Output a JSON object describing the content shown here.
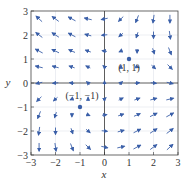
{
  "chart_data": {
    "type": "vector_field",
    "title": "",
    "xlabel": "x",
    "ylabel": "y",
    "xlim": [
      -3,
      3
    ],
    "ylim": [
      -3,
      3
    ],
    "xticks": [
      "-3",
      "-2",
      "-1",
      "0",
      "1",
      "2",
      "3"
    ],
    "yticks": [
      "-3",
      "-2",
      "-1",
      "0",
      "1",
      "2",
      "3"
    ],
    "grid": true,
    "arrow_color": "#3a5fa8",
    "equilibria": [
      {
        "x": 1,
        "y": 1,
        "label": "(1, 1)"
      },
      {
        "x": -1,
        "y": -1,
        "label": "(-1, -1)"
      }
    ],
    "grid_points": [
      -2.67,
      -2,
      -1.33,
      -0.67,
      0,
      0.67,
      1.33,
      2,
      2.67
    ],
    "arrows_description": "Upper-left: arrows point left / down-left; near y-axis top: up-left; upper-right: arrows point down; lower-right: arrows point right / down-right; lower-left: arrows point down."
  }
}
